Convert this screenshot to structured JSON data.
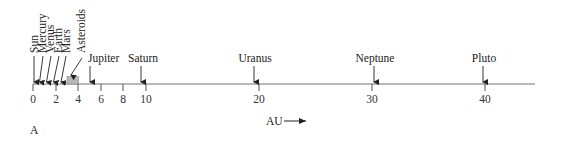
{
  "figure": {
    "panel_label": "A",
    "axis_label": "AU",
    "axis": {
      "min": 0,
      "max": 44.5,
      "ticks": [
        0,
        2,
        4,
        6,
        8,
        10,
        20,
        30,
        40
      ],
      "color": "#a0a0a0"
    },
    "bodies": [
      {
        "name": "Sun",
        "au": 0,
        "label_orientation": "vertical"
      },
      {
        "name": "Mercury",
        "au": 0.39,
        "label_orientation": "vertical"
      },
      {
        "name": "Venus",
        "au": 0.72,
        "label_orientation": "vertical"
      },
      {
        "name": "Earth",
        "au": 1.0,
        "label_orientation": "vertical"
      },
      {
        "name": "Mars",
        "au": 1.52,
        "label_orientation": "vertical"
      },
      {
        "name": "Asteroids",
        "au_range": [
          3.0,
          4.0
        ],
        "label_orientation": "vertical",
        "fill": "#b8b8b8"
      },
      {
        "name": "Jupiter",
        "au": 5.2,
        "label_orientation": "horizontal"
      },
      {
        "name": "Saturn",
        "au": 9.5,
        "label_orientation": "horizontal"
      },
      {
        "name": "Uranus",
        "au": 19.2,
        "label_orientation": "horizontal"
      },
      {
        "name": "Neptune",
        "au": 30.1,
        "label_orientation": "horizontal"
      },
      {
        "name": "Pluto",
        "au": 39.5,
        "label_orientation": "horizontal"
      }
    ]
  }
}
